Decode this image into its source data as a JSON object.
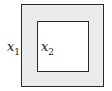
{
  "diagram": {
    "outer_region": {
      "label_var": "x",
      "label_sub": "1",
      "fill": "#ebebeb",
      "stroke": "#2a2a2a"
    },
    "inner_region": {
      "label_var": "x",
      "label_sub": "2",
      "fill": "#ffffff",
      "stroke": "#2a2a2a"
    }
  }
}
